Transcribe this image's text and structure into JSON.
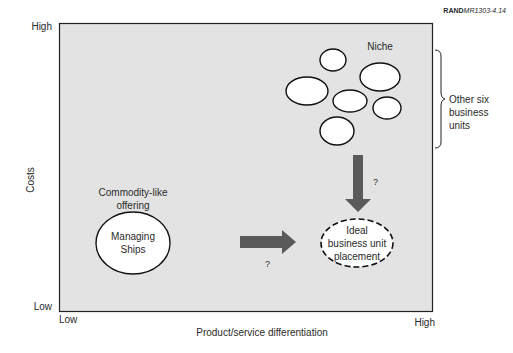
{
  "figure_id": {
    "bold": "RAND",
    "rest": "MR1303-4.14"
  },
  "axes": {
    "y_label": "Costs",
    "y_high": "High",
    "y_low": "Low",
    "x_label": "Product/service differentiation",
    "x_low": "Low",
    "x_high": "High"
  },
  "labels": {
    "niche": "Niche",
    "bracket_line1": "Other six",
    "bracket_line2": "business",
    "bracket_line3": "units",
    "commodity_line1": "Commodity-like",
    "commodity_line2": "offering",
    "managing_line1": "Managing",
    "managing_line2": "Ships",
    "ideal_line1": "Ideal",
    "ideal_line2": "business unit",
    "ideal_line3": "placement",
    "question_down": "?",
    "question_right": "?"
  },
  "colors": {
    "plot_bg": "#e3e3e3",
    "arrow": "#5a5a5a",
    "outline": "#111111"
  }
}
